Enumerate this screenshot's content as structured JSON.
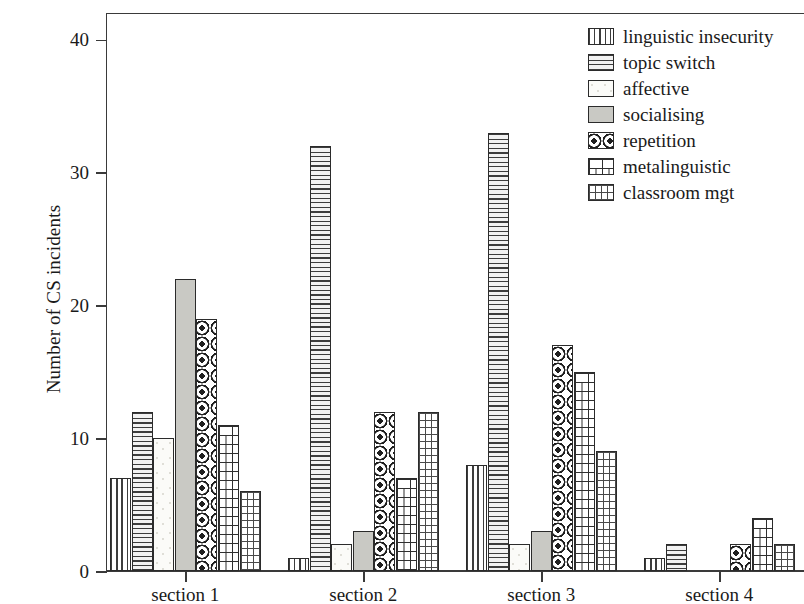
{
  "chart_data": {
    "type": "bar",
    "title": "",
    "subtitle": "",
    "xlabel": "",
    "ylabel": "Number of CS incidents",
    "categories": [
      "section 1",
      "section 2",
      "section 3",
      "section 4"
    ],
    "series": [
      {
        "name": "linguistic insecurity",
        "pattern": "vertical-lines",
        "values": [
          7,
          1,
          8,
          1
        ]
      },
      {
        "name": "topic switch",
        "pattern": "horizontal-lines",
        "values": [
          12,
          32,
          33,
          2
        ]
      },
      {
        "name": "affective",
        "pattern": "empty",
        "values": [
          10,
          2,
          2,
          0
        ]
      },
      {
        "name": "socialising",
        "pattern": "solid-gray",
        "values": [
          22,
          3,
          3,
          0
        ]
      },
      {
        "name": "repetition",
        "pattern": "rings-on-dark",
        "values": [
          19,
          12,
          17,
          2
        ]
      },
      {
        "name": "metalinguistic",
        "pattern": "brick",
        "values": [
          11,
          7,
          15,
          4
        ]
      },
      {
        "name": "classroom mgt",
        "pattern": "dashed-grid",
        "values": [
          6,
          12,
          9,
          2
        ]
      }
    ],
    "ylim": [
      0,
      42
    ],
    "yticks": [
      0,
      10,
      20,
      30,
      40
    ],
    "ytick_labels": [
      "0",
      "10",
      "20",
      "30",
      "40"
    ],
    "grid": false,
    "legend_position": "top-right",
    "bar_edge_color": "#2b2b2b",
    "axis_color": "#3a3a3a",
    "background_color": "#ffffff"
  },
  "legend": {
    "entries": [
      {
        "label": "linguistic insecurity"
      },
      {
        "label": "topic switch"
      },
      {
        "label": "affective"
      },
      {
        "label": "socialising"
      },
      {
        "label": "repetition"
      },
      {
        "label": "metalinguistic"
      },
      {
        "label": "classroom mgt"
      }
    ]
  }
}
